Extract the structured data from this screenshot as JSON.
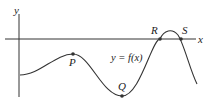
{
  "diagram": {
    "axes": {
      "x_label": "x",
      "y_label": "y"
    },
    "curve_label": "y = f(x)",
    "points": [
      {
        "name": "P",
        "label": "P",
        "description": "local maximum below x-axis"
      },
      {
        "name": "Q",
        "label": "Q",
        "description": "local minimum"
      },
      {
        "name": "R",
        "label": "R",
        "description": "x-intercept"
      },
      {
        "name": "S",
        "label": "S",
        "description": "x-intercept"
      }
    ],
    "colors": {
      "stroke": "#333333",
      "background": "#ffffff"
    }
  }
}
